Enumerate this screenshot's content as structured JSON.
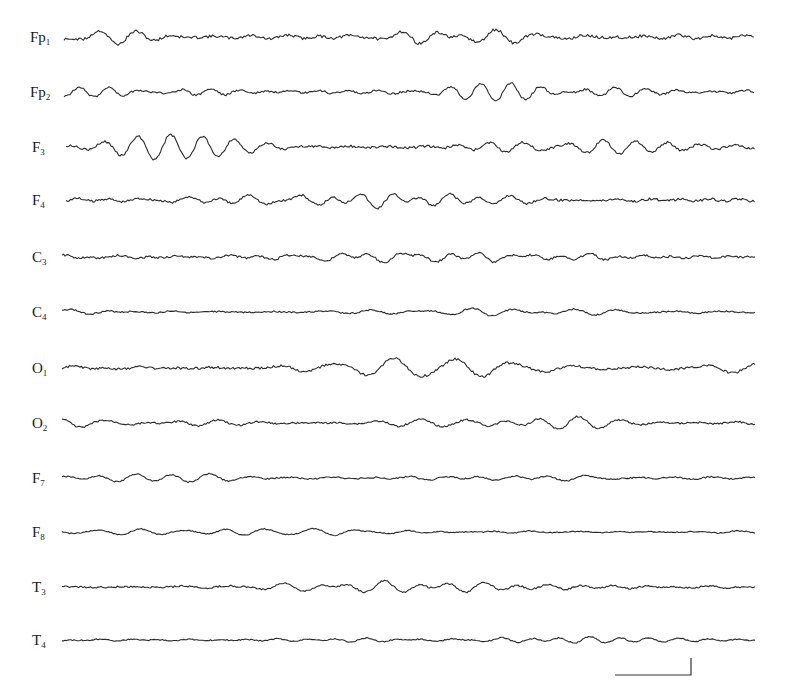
{
  "figure": {
    "type": "eeg-recording",
    "trace_x_start": 64,
    "trace_x_end": 755,
    "channels": [
      {
        "name": "Fp",
        "sub": "1",
        "baseline_y": 37,
        "amp": 8,
        "freq": 1.0,
        "seed": 11
      },
      {
        "name": "Fp",
        "sub": "2",
        "baseline_y": 92,
        "amp": 6,
        "freq": 1.1,
        "seed": 23
      },
      {
        "name": "F",
        "sub": "3",
        "baseline_y": 147,
        "amp": 7,
        "freq": 1.0,
        "seed": 37
      },
      {
        "name": "F",
        "sub": "4",
        "baseline_y": 200,
        "amp": 7,
        "freq": 1.0,
        "seed": 41
      },
      {
        "name": "C",
        "sub": "3",
        "baseline_y": 257,
        "amp": 6,
        "freq": 1.05,
        "seed": 53
      },
      {
        "name": "C",
        "sub": "4",
        "baseline_y": 312,
        "amp": 4,
        "freq": 1.0,
        "seed": 67
      },
      {
        "name": "O",
        "sub": "1",
        "baseline_y": 368,
        "amp": 7,
        "freq": 1.0,
        "seed": 71
      },
      {
        "name": "O",
        "sub": "2",
        "baseline_y": 423,
        "amp": 5,
        "freq": 1.1,
        "seed": 83
      },
      {
        "name": "F",
        "sub": "7",
        "baseline_y": 478,
        "amp": 4,
        "freq": 0.95,
        "seed": 97
      },
      {
        "name": "F",
        "sub": "8",
        "baseline_y": 532,
        "amp": 3,
        "freq": 1.0,
        "seed": 101
      },
      {
        "name": "T",
        "sub": "3",
        "baseline_y": 587,
        "amp": 5,
        "freq": 1.0,
        "seed": 113
      },
      {
        "name": "T",
        "sub": "4",
        "baseline_y": 640,
        "amp": 3.5,
        "freq": 1.0,
        "seed": 127
      }
    ],
    "scale_bar": {
      "x1": 615,
      "x2": 691,
      "y_bottom": 675,
      "y_top": 658
    },
    "colors": {
      "trace": "#2a2a2a",
      "label": "#1a1a1a",
      "background": "#ffffff"
    }
  }
}
